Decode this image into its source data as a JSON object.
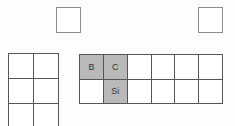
{
  "figure": {
    "kind": "periodic-table-fragment",
    "colors": {
      "highlight": "#b9b9b9",
      "grid_line": "#565656",
      "square_line": "#8c8c8c",
      "label_text": "#333333",
      "background": "#fdfdfd"
    },
    "floating_squares": [
      {
        "label": ""
      },
      {
        "label": ""
      }
    ],
    "left_grid": {
      "rows": 3,
      "cols": 2
    },
    "main_grid": {
      "rows": [
        {
          "cells": [
            {
              "label": "B",
              "highlighted": true
            },
            {
              "label": "C",
              "highlighted": true
            },
            {
              "label": "",
              "highlighted": false
            },
            {
              "label": "",
              "highlighted": false
            },
            {
              "label": "",
              "highlighted": false
            },
            {
              "label": "",
              "highlighted": false
            }
          ]
        },
        {
          "cells": [
            {
              "label": "",
              "highlighted": false
            },
            {
              "label": "Si",
              "highlighted": true
            },
            {
              "label": "",
              "highlighted": false
            },
            {
              "label": "",
              "highlighted": false
            },
            {
              "label": "",
              "highlighted": false
            },
            {
              "label": "",
              "highlighted": false
            }
          ]
        }
      ]
    }
  }
}
